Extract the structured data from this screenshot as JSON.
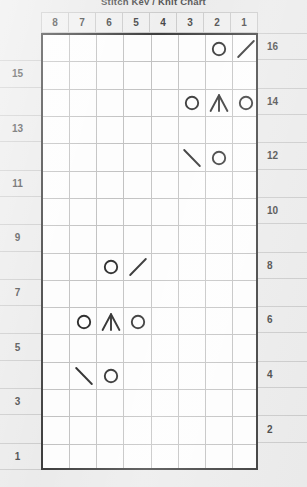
{
  "title": "Stitch Key / Knit Chart",
  "colors": {
    "page_background": "#e8e8e8",
    "grid_background": "#fdfdfd",
    "grid_border": "#232323",
    "grid_line": "#b9b9b9",
    "symbol": "#121212",
    "text": "#2e2e2e"
  },
  "chart_data": {
    "type": "table",
    "title": "Stitch Key / Knit Chart",
    "xlabel": "Stitch",
    "ylabel": "Row",
    "grid": true,
    "columns": 8,
    "rows": 16,
    "column_order": "right-to-left",
    "column_headers": [
      "8",
      "7",
      "6",
      "5",
      "4",
      "3",
      "2",
      "1"
    ],
    "row_numbers_left": [
      "15",
      "13",
      "11",
      "9",
      "7",
      "5",
      "3",
      "1"
    ],
    "row_numbers_right": [
      "16",
      "14",
      "12",
      "10",
      "8",
      "6",
      "4",
      "2"
    ],
    "legend": [
      {
        "symbol": "circle",
        "name": "yarn-over"
      },
      {
        "symbol": "slash",
        "name": "right-leaning-decrease"
      },
      {
        "symbol": "backslash",
        "name": "left-leaning-decrease"
      },
      {
        "symbol": "peak",
        "name": "centered-double-decrease"
      }
    ],
    "stitches": [
      {
        "row": 16,
        "col": 2,
        "symbol": "circle"
      },
      {
        "row": 16,
        "col": 1,
        "symbol": "slash"
      },
      {
        "row": 14,
        "col": 3,
        "symbol": "circle"
      },
      {
        "row": 14,
        "col": 2,
        "symbol": "peak"
      },
      {
        "row": 14,
        "col": 1,
        "symbol": "circle"
      },
      {
        "row": 12,
        "col": 3,
        "symbol": "backslash"
      },
      {
        "row": 12,
        "col": 2,
        "symbol": "circle"
      },
      {
        "row": 8,
        "col": 6,
        "symbol": "circle"
      },
      {
        "row": 8,
        "col": 5,
        "symbol": "slash"
      },
      {
        "row": 6,
        "col": 7,
        "symbol": "circle"
      },
      {
        "row": 6,
        "col": 6,
        "symbol": "peak"
      },
      {
        "row": 6,
        "col": 5,
        "symbol": "circle"
      },
      {
        "row": 4,
        "col": 7,
        "symbol": "backslash"
      },
      {
        "row": 4,
        "col": 6,
        "symbol": "circle"
      }
    ]
  }
}
